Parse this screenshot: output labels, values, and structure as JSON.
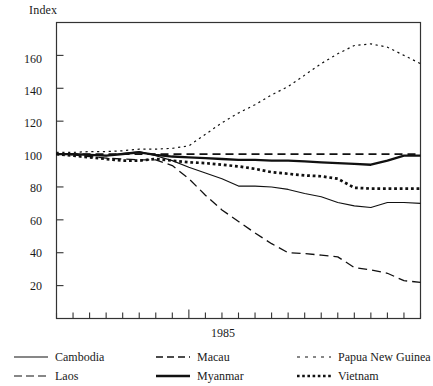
{
  "chart_data": {
    "type": "line",
    "title": "",
    "ylabel": "Index",
    "xlabel": "",
    "ylim": [
      0,
      180
    ],
    "yticks": [
      20,
      40,
      60,
      80,
      100,
      120,
      140,
      160
    ],
    "xlim": [
      1977,
      1999
    ],
    "xticks": [
      1977,
      1978,
      1979,
      1980,
      1981,
      1982,
      1983,
      1984,
      1985,
      1986,
      1987,
      1988,
      1989,
      1990,
      1991,
      1992,
      1993,
      1994,
      1995,
      1996,
      1997,
      1998,
      1999
    ],
    "xtick_labels_shown": [
      "1985"
    ],
    "grid": false,
    "legend_position": "below",
    "x": [
      1977,
      1978,
      1979,
      1980,
      1981,
      1982,
      1983,
      1984,
      1985,
      1986,
      1987,
      1988,
      1989,
      1990,
      1991,
      1992,
      1993,
      1994,
      1995,
      1996,
      1997,
      1998,
      1999
    ],
    "series": [
      {
        "name": "Cambodia",
        "style": "solid-thin",
        "values": [
          100,
          100,
          99.5,
          99,
          100.5,
          101.5,
          99,
          96,
          92,
          88.5,
          85,
          80.5,
          80.5,
          80,
          78.5,
          76,
          74,
          70.5,
          68.5,
          67.5,
          70.5,
          70.5,
          70
        ]
      },
      {
        "name": "Laos",
        "style": "dashed-long",
        "values": [
          100,
          99.5,
          98.5,
          97.5,
          97,
          96.5,
          96.5,
          93,
          85,
          75,
          66,
          59,
          52,
          45.5,
          40,
          39.5,
          38.5,
          37.5,
          31,
          29.5,
          27.5,
          23,
          22
        ]
      },
      {
        "name": "Macau",
        "style": "dashed-medium",
        "values": [
          100,
          100,
          100,
          100,
          100,
          100,
          100,
          100,
          100,
          100,
          100,
          100,
          100,
          100,
          100,
          100,
          100,
          100,
          100,
          100,
          100,
          100,
          100
        ]
      },
      {
        "name": "Myanmar",
        "style": "solid-thick",
        "values": [
          100,
          100,
          99.5,
          99,
          100,
          101,
          99.5,
          98.5,
          98,
          97.5,
          97,
          96.5,
          96.5,
          96,
          96,
          95.5,
          95,
          94.5,
          94,
          93.5,
          96,
          99,
          99
        ]
      },
      {
        "name": "Papua New Guinea",
        "style": "dotted-sparse",
        "values": [
          101,
          101,
          101.5,
          101.5,
          102,
          103,
          103,
          103.5,
          105,
          112,
          119,
          125,
          130,
          136,
          141,
          148,
          155,
          161,
          166,
          167,
          165,
          160,
          155
        ]
      },
      {
        "name": "Vietnam",
        "style": "dotted-bold",
        "values": [
          100,
          99,
          98,
          97,
          96,
          96,
          97,
          96,
          95,
          94.5,
          93.5,
          92.5,
          91,
          89,
          88,
          87,
          86.5,
          85,
          79.5,
          79,
          79,
          79,
          79
        ]
      }
    ]
  },
  "legend": {
    "items": [
      {
        "label": "Cambodia",
        "swatch": "solid-thin-icon"
      },
      {
        "label": "Macau",
        "swatch": "dashed-medium-icon"
      },
      {
        "label": "Papua New Guinea",
        "swatch": "dotted-sparse-icon"
      },
      {
        "label": "Laos",
        "swatch": "dashed-long-icon"
      },
      {
        "label": "Myanmar",
        "swatch": "solid-thick-icon"
      },
      {
        "label": "Vietnam",
        "swatch": "dotted-bold-icon"
      }
    ]
  },
  "axes": {
    "y_title": "Index",
    "y_labels": [
      "160",
      "140",
      "120",
      "100",
      "80",
      "60",
      "40",
      "20"
    ],
    "x_labels": [
      "1985"
    ]
  },
  "colors": {
    "line": "#111111",
    "frame": "#333333",
    "background": "#ffffff"
  }
}
